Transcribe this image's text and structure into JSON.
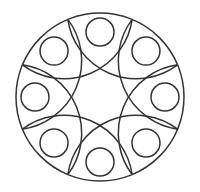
{
  "figure": {
    "title": "",
    "stroke_color": "#333333",
    "background_color": "#ffffff",
    "stroke_width": 1.5,
    "center": [
      100,
      97
    ],
    "outer_radius": 84,
    "small_circle_radius": 14,
    "small_circle_orbit": 65,
    "small_circle_count": 8,
    "arc_anchor_count": 8,
    "arc_radius": 69
  }
}
